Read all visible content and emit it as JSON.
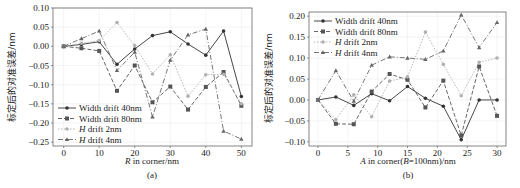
{
  "chart_data": [
    {
      "type": "line",
      "panel_label": "(a)",
      "title": "",
      "xlabel": "R in corner/nm",
      "ylabel": "标定后的对准误差/nm",
      "x": [
        0,
        5,
        10,
        15,
        20,
        25,
        30,
        35,
        40,
        45,
        50
      ],
      "xticks": [
        "0",
        "10",
        "20",
        "30",
        "40",
        "50"
      ],
      "yticks": [
        "0.10",
        "0.05",
        "0.00",
        "−0.05",
        "−0.10",
        "−0.15",
        "−0.20",
        "−0.25"
      ],
      "xlim": [
        -3,
        53
      ],
      "ylim": [
        -0.26,
        0.1
      ],
      "grid": true,
      "legend_position": "lower left",
      "series": [
        {
          "name": "Width drift 40nm",
          "marker": "circle",
          "dash": "solid",
          "color": "#333333",
          "values": [
            0.0,
            0.005,
            0.012,
            -0.047,
            -0.007,
            0.028,
            0.038,
            0.006,
            -0.023,
            0.04,
            -0.131
          ]
        },
        {
          "name": "Width drift 80nm",
          "marker": "square",
          "dash": "dashed",
          "color": "#555555",
          "values": [
            0.0,
            -0.005,
            -0.012,
            -0.116,
            -0.05,
            -0.146,
            -0.105,
            -0.165,
            -0.106,
            -0.067,
            -0.155
          ]
        },
        {
          "name": "H drift 2nm",
          "marker": "dot",
          "dash": "dotted",
          "color": "#b0b0b0",
          "values": [
            0.0,
            0.008,
            0.015,
            0.062,
            0.002,
            -0.072,
            -0.022,
            -0.13,
            -0.074,
            -0.073,
            -0.15
          ]
        },
        {
          "name": "H drift 4nm",
          "marker": "triangle",
          "dash": "dashdot",
          "color": "#666666",
          "values": [
            0.0,
            0.02,
            0.04,
            -0.063,
            -0.015,
            -0.184,
            -0.036,
            0.03,
            0.045,
            -0.221,
            -0.242
          ]
        }
      ]
    },
    {
      "type": "line",
      "panel_label": "(b)",
      "title": "",
      "xlabel": "A in corner(B=100nm)/nm",
      "ylabel": "标定后的对准误差/nm",
      "x": [
        0,
        3,
        6,
        9,
        12,
        15,
        18,
        21,
        24,
        27,
        30
      ],
      "xticks": [
        "0",
        "5",
        "10",
        "15",
        "20",
        "25",
        "30"
      ],
      "yticks": [
        "0.20",
        "0.15",
        "0.10",
        "0.05",
        "0.00",
        "−0.05",
        "−0.10"
      ],
      "xlim": [
        -1.5,
        31.5
      ],
      "ylim": [
        -0.11,
        0.21
      ],
      "grid": true,
      "legend_position": "upper left",
      "series": [
        {
          "name": "Width drift 40nm",
          "marker": "circle",
          "dash": "solid",
          "color": "#333333",
          "values": [
            0.0,
            0.007,
            -0.013,
            0.015,
            -0.002,
            0.032,
            0.004,
            -0.015,
            -0.095,
            0.0,
            0.0
          ]
        },
        {
          "name": "Width drift 80nm",
          "marker": "square",
          "dash": "dashed",
          "color": "#555555",
          "values": [
            0.0,
            -0.057,
            -0.058,
            0.02,
            0.062,
            0.048,
            -0.018,
            0.046,
            -0.085,
            0.08,
            -0.038
          ]
        },
        {
          "name": "H drift 2nm",
          "marker": "dot",
          "dash": "dotted",
          "color": "#b0b0b0",
          "values": [
            0.0,
            -0.047,
            0.012,
            -0.04,
            0.045,
            0.055,
            0.162,
            0.085,
            0.01,
            0.09,
            0.1
          ]
        },
        {
          "name": "H drift 4nm",
          "marker": "triangle",
          "dash": "dashdot",
          "color": "#666666",
          "values": [
            0.0,
            0.07,
            -0.003,
            0.083,
            0.103,
            0.1,
            0.097,
            0.117,
            0.203,
            0.125,
            0.185
          ]
        }
      ]
    }
  ],
  "panels": {
    "a": {
      "label": "(a)",
      "xlabel_italic": "R",
      "xlabel_rest": " in corner/nm",
      "ylabel": "标定后的对准误差/nm",
      "legend": [
        "Width drift 40nm",
        "Width drift 80nm",
        "H drift 2nm",
        "H drift 4nm"
      ]
    },
    "b": {
      "label": "(b)",
      "xlabel_italic": "A",
      "xlabel_mid": " in corner(",
      "xlabel_italic2": "B",
      "xlabel_rest": "=100nm)/nm",
      "ylabel": "标定后的对准误差/nm",
      "legend": [
        "Width drift 40nm",
        "Width drift 80nm",
        "H drift 2nm",
        "H drift 4nm"
      ]
    }
  }
}
